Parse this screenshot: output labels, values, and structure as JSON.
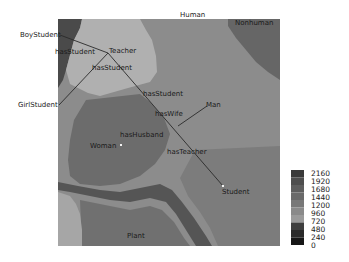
{
  "map": {
    "regions": {
      "top_label": "Human",
      "top_right_label": "Nonhuman",
      "bottom_label": "Plant"
    },
    "nodes": [
      {
        "id": "boy_student",
        "label": "BoyStudent"
      },
      {
        "id": "teacher",
        "label": "Teacher"
      },
      {
        "id": "girl_student",
        "label": "GirlStudent"
      },
      {
        "id": "man",
        "label": "Man"
      },
      {
        "id": "woman",
        "label": "Woman"
      },
      {
        "id": "student",
        "label": "Student"
      }
    ],
    "edges": [
      {
        "id": "e1",
        "label": "hasStudent"
      },
      {
        "id": "e2",
        "label": "hasStudent"
      },
      {
        "id": "e3",
        "label": "hasStudent"
      },
      {
        "id": "e4",
        "label": "hasWife"
      },
      {
        "id": "e5",
        "label": "hasHusband"
      },
      {
        "id": "e6",
        "label": "hasTeacher"
      }
    ]
  },
  "colorbar": {
    "ticks": [
      "2160",
      "1920",
      "1680",
      "1440",
      "1200",
      "960",
      "720",
      "480",
      "240",
      "0"
    ],
    "colors": [
      "#3a3a3a",
      "#4e4e4e",
      "#5e5e5e",
      "#6a6a6a",
      "#787878",
      "#8a8a8a",
      "#9a9a9a",
      "#3e3e3e",
      "#2a2a2a",
      "#161616"
    ]
  }
}
